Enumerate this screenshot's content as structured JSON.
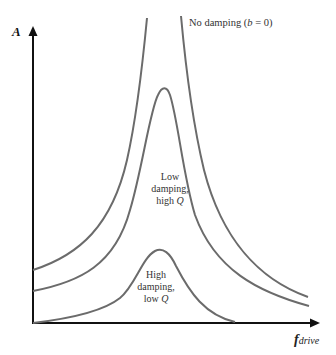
{
  "diagram": {
    "axes": {
      "y_label": "A",
      "x_label_main": "f",
      "x_label_sub": "drive"
    },
    "curves": [
      {
        "name": "no-damping",
        "label_prefix": "No damping (",
        "label_var": "b",
        "label_suffix": " = 0)"
      },
      {
        "name": "low-damping",
        "label_line1": "Low",
        "label_line2": "damping,",
        "label_line3_prefix": "high ",
        "label_line3_var": "Q"
      },
      {
        "name": "high-damping",
        "label_line1": "High",
        "label_line2": "damping,",
        "label_line3_prefix": "low ",
        "label_line3_var": "Q"
      }
    ],
    "colors": {
      "curve": "#6b6b6b",
      "axis": "#111111",
      "text": "#333333"
    }
  }
}
